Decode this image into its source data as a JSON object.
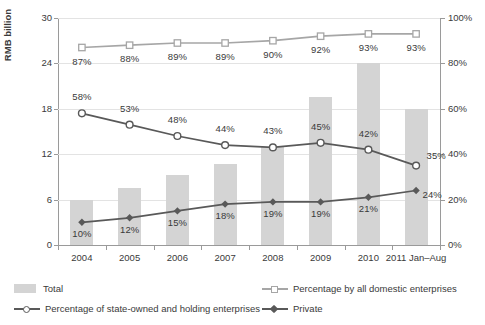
{
  "chart_data": {
    "type": "bar",
    "title": "",
    "xlabel": "",
    "ylabel": "RMB billion",
    "ylabel_right": "",
    "categories": [
      "2004",
      "2005",
      "2006",
      "2007",
      "2008",
      "2009",
      "2010",
      "2011 Jan–Aug"
    ],
    "ylim": [
      0,
      30
    ],
    "yticks": [
      0,
      6,
      12,
      18,
      24,
      30
    ],
    "ytick_labels": [
      "0",
      "6",
      "12",
      "18",
      "24",
      "30"
    ],
    "ylim_right": [
      0,
      100
    ],
    "yticks_right": [
      0,
      20,
      40,
      60,
      80,
      100
    ],
    "ytick_labels_right": [
      "0%",
      "20%",
      "40%",
      "60%",
      "80%",
      "100%"
    ],
    "grid": true,
    "legend_position": "bottom",
    "series": [
      {
        "name": "Total",
        "type": "bar",
        "axis": "left",
        "unit": "RMB billion",
        "color": "#d4d4d4",
        "values": [
          6.0,
          7.5,
          9.3,
          10.7,
          13.0,
          19.5,
          24.0,
          18.0
        ]
      },
      {
        "name": "Percentage by all domestic enterprises",
        "type": "line",
        "axis": "right",
        "marker": "open-square",
        "color": "#a6a6a6",
        "values": [
          87,
          88,
          89,
          89,
          90,
          92,
          93,
          93
        ],
        "labels": [
          "87%",
          "88%",
          "89%",
          "89%",
          "90%",
          "92%",
          "93%",
          "93%"
        ]
      },
      {
        "name": "Percentage of state-owned and holding enterprises",
        "type": "line",
        "axis": "right",
        "marker": "open-circle",
        "color": "#595959",
        "values": [
          58,
          53,
          48,
          44,
          43,
          45,
          42,
          35
        ],
        "labels": [
          "58%",
          "53%",
          "48%",
          "44%",
          "43%",
          "45%",
          "42%",
          "35%"
        ]
      },
      {
        "name": "Private",
        "type": "line",
        "axis": "right",
        "marker": "filled-diamond",
        "color": "#595959",
        "values": [
          10,
          12,
          15,
          18,
          19,
          19,
          21,
          24
        ],
        "labels": [
          "10%",
          "12%",
          "15%",
          "18%",
          "19%",
          "19%",
          "21%",
          "24%"
        ]
      }
    ]
  },
  "legend": {
    "items": [
      {
        "label": "Total",
        "marker": "bar-swatch",
        "color": "#d4d4d4"
      },
      {
        "label": "Percentage by all domestic enterprises",
        "marker": "open-square",
        "color": "#a6a6a6"
      },
      {
        "label": "Percentage of state-owned and holding enterprises",
        "marker": "open-circle",
        "color": "#595959"
      },
      {
        "label": "Private",
        "marker": "filled-diamond",
        "color": "#595959"
      }
    ]
  }
}
